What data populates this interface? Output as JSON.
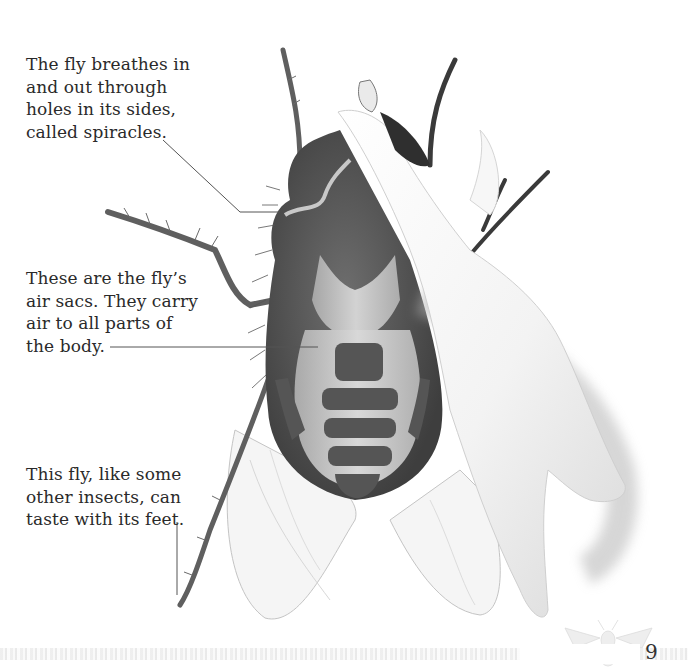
{
  "captions": {
    "spiracles": {
      "lines": [
        "The fly breathes in",
        "and out through",
        "holes in its sides,",
        "called spiracles."
      ]
    },
    "air_sacs": {
      "lines": [
        "These are the fly’s",
        "air sacs. They carry",
        "air to all parts of",
        "the body."
      ]
    },
    "feet": {
      "lines": [
        "This fly, like some",
        "other insects, can",
        "taste with its feet."
      ]
    }
  },
  "page_number": "9",
  "illustration": {
    "subject": "fly with outer covering peeled back showing air sacs",
    "colors": {
      "body_dark": "#4a4a4a",
      "body_mid": "#6b6b6b",
      "air_sac": "#b9b9b9",
      "air_sac_highlight": "#d6d6d6",
      "wing": "#f4f4f4",
      "wing_edge": "#bdbdbd",
      "peel_flap": "#f1f1f1",
      "leg": "#6a6a6a",
      "leader_line": "#555555"
    }
  },
  "footer": {
    "bee_icon": "bee-icon"
  }
}
